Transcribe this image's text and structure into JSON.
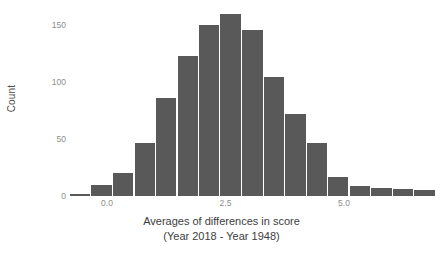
{
  "chart_data": {
    "type": "bar",
    "title": "",
    "subtitle": "",
    "xlabel_line1": "Averages of differences in score",
    "xlabel_line2": "(Year 2018 - Year 1948)",
    "ylabel": "Count",
    "xlim": [
      -0.78,
      6.94
    ],
    "ylim": [
      0,
      167
    ],
    "grid": false,
    "legend": null,
    "bar_color": "#595959",
    "background_color": "#ffffff",
    "bin_width": 0.4541,
    "x_ticks": [
      {
        "value": 0.0,
        "label": "0.0"
      },
      {
        "value": 2.5,
        "label": "2.5"
      },
      {
        "value": 5.0,
        "label": "5.0"
      }
    ],
    "y_ticks": [
      {
        "value": 0,
        "label": "0"
      },
      {
        "value": 50,
        "label": "50"
      },
      {
        "value": 100,
        "label": "100"
      },
      {
        "value": 150,
        "label": "150"
      }
    ],
    "categories": [
      "-0.78 to -0.33",
      "-0.33 to 0.13",
      "0.13 to 0.58",
      "0.58 to 1.03",
      "1.03 to 1.49",
      "1.49 to 1.94",
      "1.94 to 2.40",
      "2.40 to 2.85",
      "2.85 to 3.30",
      "3.30 to 3.76",
      "3.76 to 4.21",
      "4.21 to 4.67",
      "4.67 to 5.12",
      "5.12 to 5.57",
      "5.57 to 6.03",
      "6.03 to 6.48",
      "6.48 to 6.94"
    ],
    "bin_centers": [
      -0.56,
      -0.1,
      0.35,
      0.81,
      1.26,
      1.72,
      2.17,
      2.62,
      3.08,
      3.53,
      3.99,
      4.44,
      4.89,
      5.35,
      5.8,
      6.26,
      6.71
    ],
    "values": [
      2,
      10,
      20,
      47,
      86,
      123,
      150,
      160,
      146,
      105,
      72,
      47,
      17,
      9,
      7,
      6,
      5
    ]
  }
}
